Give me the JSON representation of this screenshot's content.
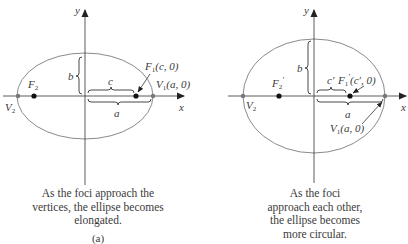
{
  "figure": {
    "colors": {
      "ellipse": "#8a8a8a",
      "axes": "#333333",
      "text": "#3a3a3a",
      "points": "#111111",
      "vertex_points": "#777777"
    },
    "panel_a": {
      "axis_x_label": "x",
      "axis_y_label": "y",
      "focus_left_label": "F",
      "focus_left_sub": "2",
      "focus_right_label": "F",
      "focus_right_sub": "1",
      "focus_right_coords": "(c, 0)",
      "vertex_left_label": "V",
      "vertex_left_sub": "2",
      "vertex_right_label": "V",
      "vertex_right_sub": "1",
      "vertex_right_coords": "(a, 0)",
      "brace_b": "b",
      "brace_c": "c",
      "brace_a": "a",
      "caption": [
        "As the foci approach the",
        "vertices, the ellipse becomes",
        "elongated."
      ],
      "sublabel": "(a)"
    },
    "panel_b": {
      "axis_x_label": "x",
      "axis_y_label": "y",
      "focus_left_label": "F",
      "focus_left_sub": "2",
      "focus_left_prime": "′",
      "focus_right_label": "F",
      "focus_right_sub": "1",
      "focus_right_prime": "′",
      "focus_right_coords": "(c′, 0)",
      "vertex_left_label": "V",
      "vertex_left_sub": "2",
      "vertex_right_label": "V",
      "vertex_right_sub": "1",
      "vertex_right_coords": "(a, 0)",
      "brace_b": "b",
      "brace_c": "c′",
      "brace_a": "a",
      "caption": [
        "As the foci",
        "approach each other,",
        "the ellipse becomes",
        "more circular."
      ]
    }
  }
}
